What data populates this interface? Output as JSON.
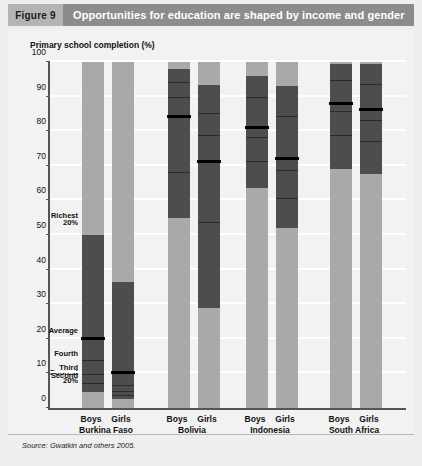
{
  "figure": {
    "tag": "Figure 9",
    "title": "Opportunities for education are shaped by income and gender",
    "source": "Source: Gwatkin and others 2005."
  },
  "chart_data": {
    "type": "bar",
    "title": "Opportunities for education are shaped by income and gender",
    "ylabel": "Primary school completion (%)",
    "xlabel": "",
    "ylim": [
      0,
      100
    ],
    "yticks": [
      0,
      10,
      20,
      30,
      40,
      50,
      60,
      70,
      80,
      90,
      100
    ],
    "grid": true,
    "legend_position": "inline-annotations",
    "annotations": [
      {
        "label": "Richest 20%",
        "value": 50
      },
      {
        "label": "Average",
        "value": 20
      },
      {
        "label": "Fourth",
        "value": 13.5
      },
      {
        "label": "Third",
        "value": 9.5
      },
      {
        "label": "Second",
        "value": 7
      },
      {
        "label": "Poorest 20%",
        "value": 4.5
      }
    ],
    "groups": [
      "Burkina Faso",
      "Bolivia",
      "Indonesia",
      "South Africa"
    ],
    "categories": [
      "Boys",
      "Girls",
      "Boys",
      "Girls",
      "Boys",
      "Girls",
      "Boys",
      "Girls"
    ],
    "series": [
      {
        "name": "Burkina Faso Boys",
        "group": "Burkina Faso",
        "sex": "Boys",
        "richest": 50,
        "poorest": 4.5,
        "average": 20,
        "quintiles": [
          13.5,
          9.5,
          7
        ]
      },
      {
        "name": "Burkina Faso Girls",
        "group": "Burkina Faso",
        "sex": "Girls",
        "richest": 36.5,
        "poorest": 2.5,
        "average": 10,
        "quintiles": [
          6.5,
          4.5,
          3.5
        ]
      },
      {
        "name": "Bolivia Boys",
        "group": "Bolivia",
        "sex": "Boys",
        "richest": 98,
        "poorest": 55,
        "average": 84,
        "quintiles": [
          94,
          89.5,
          68
        ]
      },
      {
        "name": "Bolivia Girls",
        "group": "Bolivia",
        "sex": "Girls",
        "richest": 93.5,
        "poorest": 29,
        "average": 71,
        "quintiles": [
          85,
          78.5,
          53.5
        ]
      },
      {
        "name": "Indonesia Boys",
        "group": "Indonesia",
        "sex": "Boys",
        "richest": 96,
        "poorest": 63.5,
        "average": 81,
        "quintiles": [
          89.5,
          78,
          71
        ]
      },
      {
        "name": "Indonesia Girls",
        "group": "Indonesia",
        "sex": "Girls",
        "richest": 93,
        "poorest": 52,
        "average": 72,
        "quintiles": [
          84,
          68.5,
          60.5
        ]
      },
      {
        "name": "South Africa Boys",
        "group": "South Africa",
        "sex": "Boys",
        "richest": 99.5,
        "poorest": 69,
        "average": 88,
        "quintiles": [
          94.5,
          85.5,
          78.5
        ]
      },
      {
        "name": "South Africa Girls",
        "group": "South Africa",
        "sex": "Girls",
        "richest": 99.5,
        "poorest": 67.5,
        "average": 86,
        "quintiles": [
          93.5,
          83,
          77
        ]
      }
    ],
    "colors": {
      "bar_light": "#a9a9a9",
      "bar_dark": "#4d4d4d",
      "average_line": "#000000",
      "quintile_line": "#2b2b2b",
      "panel_background": "#f2f2f2",
      "gridline": "#ffffff",
      "header_tag": "#b4b4b4",
      "header_band": "#8c8c8c"
    }
  }
}
